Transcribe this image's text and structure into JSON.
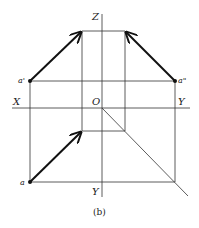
{
  "figure": {
    "caption": "(b)",
    "axes": {
      "z": "Z",
      "x": "X",
      "y_right": "Y",
      "y_bottom": "Y",
      "origin": "O"
    },
    "points": {
      "front_view": "a'",
      "side_view": "a\"",
      "top_view": "a"
    },
    "colors": {
      "line": "#333333",
      "arrow": "#111111"
    }
  }
}
